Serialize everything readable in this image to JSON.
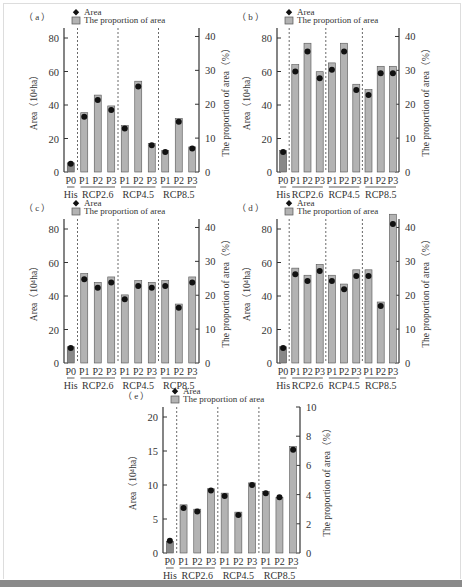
{
  "legend": {
    "marker_label": "Area",
    "bar_label": "The proportion of area"
  },
  "axis": {
    "left_label": "Area（10⁴ha）",
    "right_label": "The proportion of area（%）"
  },
  "groups": [
    "His",
    "RCP2.6",
    "RCP4.5",
    "RCP8.5"
  ],
  "categories": [
    "P0",
    "P1",
    "P2",
    "P3",
    "P1",
    "P2",
    "P3",
    "P1",
    "P2",
    "P3"
  ],
  "colors": {
    "bar": "#b3b3b3",
    "bar_his": "#888888",
    "bar_stroke": "#555555",
    "marker": "#111111",
    "axis": "#333333"
  },
  "chart_data": [
    {
      "type": "bar",
      "panel": "(a)",
      "categories": [
        "P0",
        "RCP2.6-P1",
        "RCP2.6-P2",
        "RCP2.6-P3",
        "RCP4.5-P1",
        "RCP4.5-P2",
        "RCP4.5-P3",
        "RCP8.5-P1",
        "RCP8.5-P2",
        "RCP8.5-P3"
      ],
      "series": [
        {
          "name": "Area",
          "axis": "left",
          "values": [
            5,
            33,
            43,
            37,
            26,
            51,
            16,
            12,
            30,
            14
          ]
        },
        {
          "name": "The proportion of area",
          "axis": "right",
          "values": [
            2.7,
            17.5,
            22.7,
            19.5,
            13.7,
            26.8,
            8.4,
            6.3,
            15.8,
            7.4
          ]
        }
      ],
      "ylabel": "Area（10⁴ha）",
      "y2label": "The proportion of area（%）",
      "ylim": [
        0,
        80
      ],
      "yticks": [
        0,
        20,
        40,
        60,
        80
      ],
      "y2lim": [
        0,
        42.5
      ],
      "y2ticks": [
        0,
        10,
        20,
        30,
        40
      ]
    },
    {
      "type": "bar",
      "panel": "(b)",
      "categories": [
        "P0",
        "RCP2.6-P1",
        "RCP2.6-P2",
        "RCP2.6-P3",
        "RCP4.5-P1",
        "RCP4.5-P2",
        "RCP4.5-P3",
        "RCP8.5-P1",
        "RCP8.5-P2",
        "RCP8.5-P3"
      ],
      "series": [
        {
          "name": "Area",
          "axis": "left",
          "values": [
            12,
            60,
            72,
            56,
            61,
            72,
            49,
            46,
            59,
            59
          ]
        },
        {
          "name": "The proportion of area",
          "axis": "right",
          "values": [
            6.3,
            31.7,
            38.0,
            29.6,
            32.2,
            38.0,
            25.9,
            24.3,
            31.2,
            31.2
          ]
        }
      ],
      "ylabel": "Area（10⁴ha）",
      "y2label": "The proportion of area（%）",
      "ylim": [
        0,
        80
      ],
      "yticks": [
        0,
        20,
        40,
        60,
        80
      ],
      "y2lim": [
        0,
        42.5
      ],
      "y2ticks": [
        0,
        10,
        20,
        30,
        40
      ]
    },
    {
      "type": "bar",
      "panel": "(c)",
      "categories": [
        "P0",
        "RCP2.6-P1",
        "RCP2.6-P2",
        "RCP2.6-P3",
        "RCP4.5-P1",
        "RCP4.5-P2",
        "RCP4.5-P3",
        "RCP8.5-P1",
        "RCP8.5-P2",
        "RCP8.5-P3"
      ],
      "series": [
        {
          "name": "Area",
          "axis": "left",
          "values": [
            9,
            50,
            45,
            48,
            38,
            46,
            45,
            46,
            33,
            48
          ]
        },
        {
          "name": "The proportion of area",
          "axis": "right",
          "values": [
            4.8,
            26.4,
            23.8,
            25.4,
            20.1,
            24.3,
            23.8,
            24.3,
            17.4,
            25.4
          ]
        }
      ],
      "ylabel": "Area（10⁴ha）",
      "y2label": "The proportion of area（%）",
      "ylim": [
        0,
        80
      ],
      "yticks": [
        0,
        20,
        40,
        60,
        80
      ],
      "y2lim": [
        0,
        42.5
      ],
      "y2ticks": [
        0,
        10,
        20,
        30,
        40
      ]
    },
    {
      "type": "bar",
      "panel": "(d)",
      "categories": [
        "P0",
        "RCP2.6-P1",
        "RCP2.6-P2",
        "RCP2.6-P3",
        "RCP4.5-P1",
        "RCP4.5-P2",
        "RCP4.5-P3",
        "RCP8.5-P1",
        "RCP8.5-P2",
        "RCP8.5-P3"
      ],
      "series": [
        {
          "name": "Area",
          "axis": "left",
          "values": [
            9,
            53,
            49,
            55,
            49,
            44,
            52,
            52,
            34,
            83
          ]
        },
        {
          "name": "The proportion of area",
          "axis": "right",
          "values": [
            4.8,
            28.0,
            25.9,
            29.1,
            25.9,
            23.3,
            27.5,
            27.5,
            18.0,
            43.9
          ]
        }
      ],
      "ylabel": "Area（10⁴ha）",
      "y2label": "The proportion of area（%）",
      "ylim": [
        0,
        80
      ],
      "yticks": [
        0,
        20,
        40,
        60,
        80
      ],
      "y2lim": [
        0,
        42.5
      ],
      "y2ticks": [
        0,
        10,
        20,
        30,
        40
      ]
    },
    {
      "type": "bar",
      "panel": "(e)",
      "categories": [
        "P0",
        "RCP2.6-P1",
        "RCP2.6-P2",
        "RCP2.6-P3",
        "RCP4.5-P1",
        "RCP4.5-P2",
        "RCP4.5-P3",
        "RCP8.5-P1",
        "RCP8.5-P2",
        "RCP8.5-P3"
      ],
      "series": [
        {
          "name": "Area",
          "axis": "left",
          "values": [
            1.8,
            6.6,
            6.1,
            9.2,
            8.4,
            5.6,
            10.0,
            8.8,
            8.2,
            15.2
          ]
        },
        {
          "name": "The proportion of area",
          "axis": "right",
          "values": [
            0.8,
            3.3,
            3.0,
            4.4,
            4.1,
            2.8,
            4.8,
            4.2,
            3.8,
            7.3
          ]
        }
      ],
      "ylabel": "Area（10⁴ha）",
      "y2label": "The proportion of area（%）",
      "ylim": [
        0,
        20
      ],
      "yticks": [
        0,
        5,
        10,
        15,
        20
      ],
      "y2lim": [
        0,
        10
      ],
      "y2ticks": [
        0,
        2,
        4,
        6,
        8,
        10
      ]
    }
  ]
}
